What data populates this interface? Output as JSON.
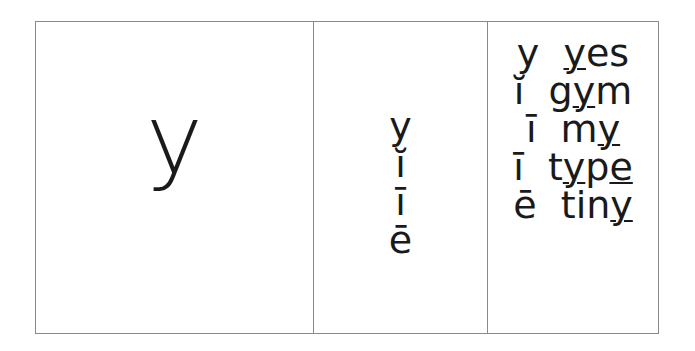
{
  "card": {
    "grapheme": "y",
    "sounds": [
      "y",
      "ĭ",
      "ī",
      "ē"
    ],
    "examples": [
      {
        "sound": "y",
        "parts": [
          {
            "t": "y",
            "u": true
          },
          {
            "t": "es",
            "u": false
          }
        ]
      },
      {
        "sound": "ĭ",
        "parts": [
          {
            "t": "g",
            "u": false
          },
          {
            "t": "y",
            "u": true
          },
          {
            "t": "m",
            "u": false
          }
        ]
      },
      {
        "sound": "ī",
        "parts": [
          {
            "t": "m",
            "u": false
          },
          {
            "t": "y",
            "u": true
          }
        ]
      },
      {
        "sound": "ī",
        "parts": [
          {
            "t": "t",
            "u": false
          },
          {
            "t": "y",
            "u": true
          },
          {
            "t": "p",
            "u": false
          },
          {
            "t": "e",
            "u": true
          }
        ]
      },
      {
        "sound": "ē",
        "parts": [
          {
            "t": "tin",
            "u": false
          },
          {
            "t": "y",
            "u": true
          }
        ]
      }
    ]
  },
  "colors": {
    "border": "#8a8a8a",
    "text": "#1a1a1a"
  }
}
